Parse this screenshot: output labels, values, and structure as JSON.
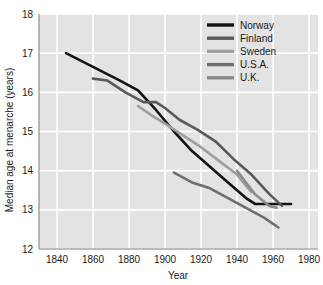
{
  "chart_data": {
    "type": "line",
    "title": "",
    "xlabel": "Year",
    "ylabel": "Median age at menarche (years)",
    "xlim": [
      1830,
      1985
    ],
    "ylim": [
      12,
      18
    ],
    "xticks": [
      1840,
      1860,
      1880,
      1900,
      1920,
      1940,
      1960,
      1980
    ],
    "yticks": [
      12,
      13,
      14,
      15,
      16,
      17,
      18
    ],
    "grid": true,
    "legend_position": "top-right",
    "background_color": "#e3e3e3",
    "gridline_color": "#ffffff",
    "series": [
      {
        "name": "Norway",
        "color": "#141414",
        "width": 2.6,
        "x": [
          1845,
          1860,
          1875,
          1885,
          1895,
          1905,
          1915,
          1925,
          1935,
          1945,
          1950,
          1960,
          1970
        ],
        "values": [
          17.0,
          16.65,
          16.3,
          16.05,
          15.55,
          15.0,
          14.5,
          14.1,
          13.7,
          13.3,
          13.15,
          13.15,
          13.15
        ]
      },
      {
        "name": "Finland",
        "color": "#595959",
        "width": 2.6,
        "x": [
          1860,
          1868,
          1878,
          1888,
          1895,
          1900,
          1908,
          1918,
          1928,
          1938,
          1948,
          1958,
          1965
        ],
        "values": [
          16.35,
          16.3,
          16.0,
          15.75,
          15.75,
          15.6,
          15.3,
          15.05,
          14.75,
          14.3,
          13.9,
          13.4,
          13.1
        ]
      },
      {
        "name": "Sweden",
        "color": "#9e9e9e",
        "width": 2.6,
        "x": [
          1885,
          1893,
          1900,
          1910,
          1920,
          1930,
          1940,
          1948
        ],
        "values": [
          15.65,
          15.4,
          15.2,
          14.9,
          14.6,
          14.25,
          13.9,
          13.45
        ]
      },
      {
        "name": "U.S.A.",
        "color": "#6e6e6e",
        "width": 2.6,
        "x": [
          1905,
          1915,
          1925,
          1935,
          1945,
          1955,
          1963
        ],
        "values": [
          13.95,
          13.7,
          13.55,
          13.3,
          13.05,
          12.8,
          12.55
        ]
      },
      {
        "name": "U.K.",
        "color": "#8a8a8a",
        "width": 2.6,
        "x": [
          1940,
          1950,
          1958,
          1962
        ],
        "values": [
          14.0,
          13.4,
          13.1,
          13.05
        ]
      }
    ]
  },
  "legend": {
    "items": [
      {
        "label": "Norway",
        "color": "#141414"
      },
      {
        "label": "Finland",
        "color": "#595959"
      },
      {
        "label": "Sweden",
        "color": "#9e9e9e"
      },
      {
        "label": "U.S.A.",
        "color": "#6e6e6e"
      },
      {
        "label": "U.K.",
        "color": "#8a8a8a"
      }
    ]
  }
}
